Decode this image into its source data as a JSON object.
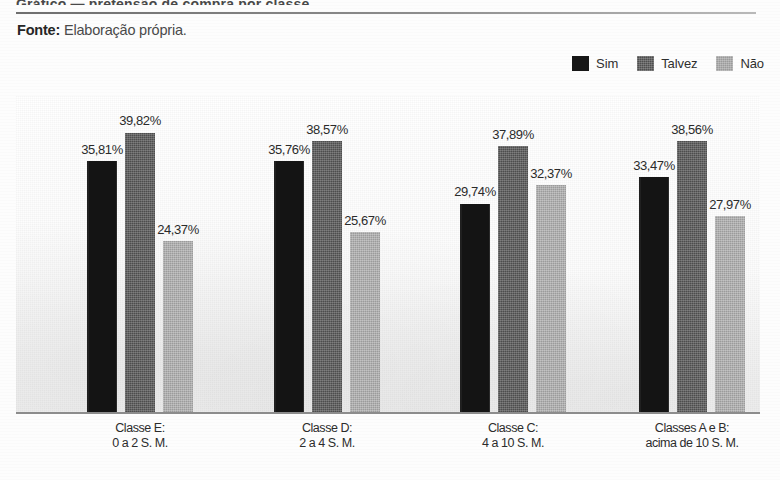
{
  "header": {
    "cut_title": "Gráfico — pretensão de compra por classe",
    "source_label": "Fonte:",
    "source_value": "Elaboração própria."
  },
  "legend": {
    "position": "top-right",
    "items": [
      {
        "label": "Sim",
        "color": "#141414",
        "swatch": "sw-sim"
      },
      {
        "label": "Talvez",
        "color": "#4d4d4d",
        "swatch": "sw-talvez"
      },
      {
        "label": "Não",
        "color": "#9b9b9b",
        "swatch": "sw-nao"
      }
    ]
  },
  "chart_data": {
    "type": "bar",
    "title": "",
    "xlabel": "",
    "ylabel": "",
    "ylim": [
      0,
      45
    ],
    "grid": false,
    "legend_position": "top-right",
    "value_suffix": "%",
    "decimal_separator": ",",
    "categories": [
      "Classe E:\n0 a 2 S. M.",
      "Classe D:\n2 a 4 S. M.",
      "Classe C:\n4 a 10 S. M.",
      "Classes A e B:\nacima de 10 S. M."
    ],
    "category_lines": [
      {
        "line1": "Classe E:",
        "line2": "0 a 2 S. M."
      },
      {
        "line1": "Classe D:",
        "line2": "2 a 4 S. M."
      },
      {
        "line1": "Classe C:",
        "line2": "4 a 10 S. M."
      },
      {
        "line1": "Classes A e B:",
        "line2": "acima de 10 S. M."
      }
    ],
    "series": [
      {
        "name": "Sim",
        "color": "#141414",
        "values": [
          35.81,
          35.76,
          29.74,
          33.47
        ],
        "labels": [
          "35,81%",
          "35,76%",
          "29,74%",
          "33,47%"
        ]
      },
      {
        "name": "Talvez",
        "color": "#4d4d4d",
        "values": [
          39.82,
          38.57,
          37.89,
          38.56
        ],
        "labels": [
          "39,82%",
          "38,57%",
          "37,89%",
          "38,56%"
        ]
      },
      {
        "name": "Não",
        "color": "#9b9b9b",
        "values": [
          24.37,
          25.67,
          32.37,
          27.97
        ],
        "labels": [
          "24,37%",
          "25,67%",
          "32,37%",
          "27,97%"
        ]
      }
    ]
  }
}
